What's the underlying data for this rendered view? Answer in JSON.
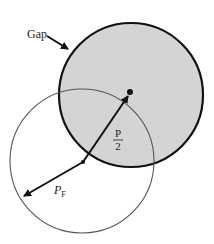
{
  "diagram": {
    "labels": {
      "gap": "Gap",
      "half_numerator": "P",
      "half_denominator": "2",
      "pf_main": "P",
      "pf_sub": "F"
    },
    "colors": {
      "shaded_fill": "#d4d4d4",
      "line": "#111111",
      "thin_line": "#555555",
      "background": "#ffffff"
    },
    "shapes": {
      "shaded_circle": {
        "cx": 131,
        "cy": 95,
        "r": 72
      },
      "thin_circle": {
        "cx": 82,
        "cy": 161,
        "r": 72
      },
      "center_dot": {
        "cx": 130,
        "cy": 92
      }
    }
  }
}
